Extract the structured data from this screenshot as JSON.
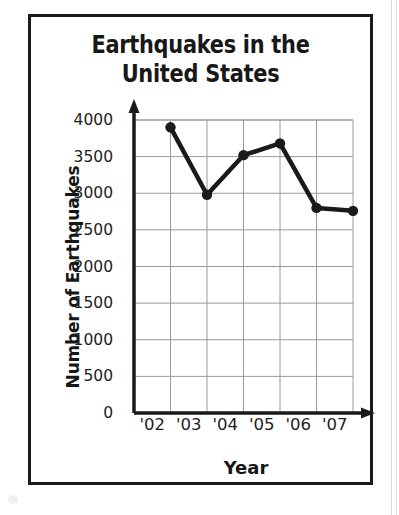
{
  "figure": {
    "title_line1": "Earthquakes in the",
    "title_line2": "United States",
    "border_color": "#1a1a1a",
    "background": "#ffffff"
  },
  "chart_data": {
    "type": "line",
    "title": "Earthquakes in the United States",
    "xlabel": "Year",
    "ylabel": "Number of Earthquakes",
    "categories": [
      "'02",
      "'03",
      "'04",
      "'05",
      "'06",
      "'07"
    ],
    "values": [
      3900,
      2980,
      3520,
      3680,
      2800,
      2760
    ],
    "ylim": [
      0,
      4000
    ],
    "ytick_labels": [
      "0",
      "500",
      "1000",
      "1500",
      "2000",
      "2500",
      "3000",
      "3500",
      "4000"
    ],
    "yticks": [
      0,
      500,
      1000,
      1500,
      2000,
      2500,
      3000,
      3500,
      4000
    ],
    "xtick_labels": [
      "'02",
      "'03",
      "'04",
      "'05",
      "'06",
      "'07"
    ],
    "grid": true,
    "grid_color": "#9a9a9a",
    "legend": null,
    "marker": "filled-circle",
    "line_color": "#1a1a1a",
    "marker_color": "#1a1a1a",
    "axis_arrows": true
  }
}
